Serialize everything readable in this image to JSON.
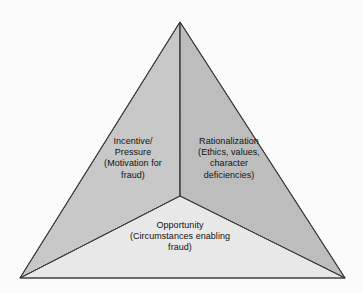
{
  "diagram": {
    "name": "fraud-triangle",
    "type": "triangle-three-segment",
    "background_color": "#fbfbfb",
    "outline_color": "#3a3a3a",
    "text_color": "#111111",
    "geometry": {
      "apex": [
        180,
        22
      ],
      "bottom_left": [
        20,
        278
      ],
      "bottom_right": [
        345,
        278
      ],
      "centroid": [
        180,
        196
      ]
    },
    "segments": [
      {
        "id": "incentive-pressure",
        "position": "left",
        "fill_color": "#c8c8c8",
        "heading": "Incentive/",
        "label": "Incentive/\nPressure\n(Motivation for\nfraud)"
      },
      {
        "id": "rationalization",
        "position": "right",
        "fill_color": "#bdbdbd",
        "heading": "Rationalization",
        "label": "Rationalization\n(Ethics, values,\ncharacter\ndeficiencies)"
      },
      {
        "id": "opportunity",
        "position": "bottom",
        "fill_color": "#e8e8e8",
        "heading": "Opportunity",
        "label": "Opportunity\n(Circumstances enabling\nfraud)"
      }
    ]
  }
}
